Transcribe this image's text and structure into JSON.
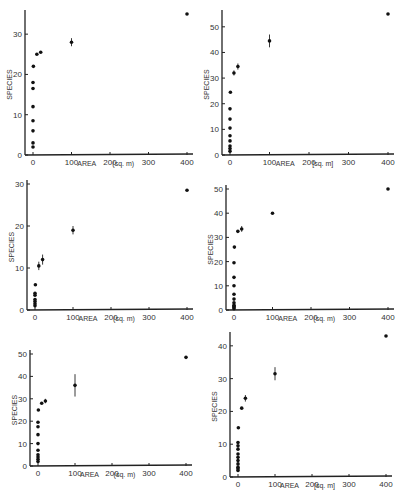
{
  "figure": {
    "panel_count": 6,
    "layout": "3 rows x 2 columns"
  },
  "chart_data": [
    {
      "type": "scatter",
      "title": "",
      "xlabel": "AREA",
      "xunit": "(sq. m)",
      "ylabel": "SPECIES",
      "xlim": [
        0,
        400
      ],
      "ylim": [
        0,
        35
      ],
      "xticks": [
        0,
        100,
        200,
        300,
        400
      ],
      "yticks": [
        0,
        10,
        20,
        30
      ],
      "grid": false,
      "points": [
        {
          "x": 0,
          "y": 2
        },
        {
          "x": 0,
          "y": 3
        },
        {
          "x": 0,
          "y": 6
        },
        {
          "x": 0,
          "y": 8.5
        },
        {
          "x": 0,
          "y": 12
        },
        {
          "x": 0,
          "y": 16.5
        },
        {
          "x": 0,
          "y": 18
        },
        {
          "x": 1,
          "y": 22
        },
        {
          "x": 10,
          "y": 25
        },
        {
          "x": 20,
          "y": 25.5
        },
        {
          "x": 100,
          "y": 28,
          "err": 1
        },
        {
          "x": 400,
          "y": 35
        }
      ],
      "frame": {
        "left": 25,
        "top": 10,
        "width": 168,
        "height": 145
      }
    },
    {
      "type": "scatter",
      "title": "",
      "xlabel": "AREA",
      "xunit": "[sq. m]",
      "ylabel": "SPECIES",
      "xlim": [
        0,
        400
      ],
      "ylim": [
        0,
        55
      ],
      "xticks": [
        0,
        100,
        200,
        300,
        400
      ],
      "yticks": [
        0,
        10,
        20,
        30,
        40,
        50
      ],
      "grid": false,
      "points": [
        {
          "x": 0,
          "y": 1.5
        },
        {
          "x": 0,
          "y": 2.5
        },
        {
          "x": 0,
          "y": 3.5
        },
        {
          "x": 0,
          "y": 5.5
        },
        {
          "x": 0,
          "y": 7.5
        },
        {
          "x": 0,
          "y": 10.5
        },
        {
          "x": 0,
          "y": 14
        },
        {
          "x": 0,
          "y": 18
        },
        {
          "x": 1,
          "y": 24.5
        },
        {
          "x": 10,
          "y": 32,
          "err": 1
        },
        {
          "x": 20,
          "y": 34.5,
          "err": 1.2
        },
        {
          "x": 100,
          "y": 44.5,
          "err": 2.5
        },
        {
          "x": 400,
          "y": 55
        }
      ],
      "frame": {
        "left": 222,
        "top": 10,
        "width": 172,
        "height": 145
      }
    },
    {
      "type": "scatter",
      "title": "",
      "xlabel": "AREA",
      "xunit": "(sq. m)",
      "ylabel": "SPECIES",
      "xlim": [
        0,
        400
      ],
      "ylim": [
        0,
        30
      ],
      "xticks": [
        0,
        100,
        200,
        300,
        400
      ],
      "yticks": [
        0,
        10,
        20,
        30
      ],
      "grid": false,
      "points": [
        {
          "x": 0,
          "y": 1
        },
        {
          "x": 0,
          "y": 1.5
        },
        {
          "x": 0,
          "y": 2
        },
        {
          "x": 0,
          "y": 2.5
        },
        {
          "x": 0,
          "y": 3.5
        },
        {
          "x": 0,
          "y": 4
        },
        {
          "x": 1,
          "y": 6
        },
        {
          "x": 10,
          "y": 10.5,
          "err": 1
        },
        {
          "x": 20,
          "y": 12,
          "err": 1.2
        },
        {
          "x": 100,
          "y": 19,
          "err": 1
        },
        {
          "x": 400,
          "y": 28.5
        }
      ],
      "frame": {
        "left": 27,
        "top": 180,
        "width": 166,
        "height": 130
      }
    },
    {
      "type": "scatter",
      "title": "",
      "xlabel": "AREA",
      "xunit": "(sq. m)",
      "ylabel": "SPECIES",
      "xlim": [
        0,
        400
      ],
      "ylim": [
        0,
        50
      ],
      "xticks": [
        0,
        100,
        200,
        300,
        400
      ],
      "yticks": [
        0,
        10,
        20,
        30,
        40,
        50
      ],
      "grid": false,
      "points": [
        {
          "x": 0,
          "y": 0.5
        },
        {
          "x": 0,
          "y": 1
        },
        {
          "x": 0,
          "y": 1.5
        },
        {
          "x": 0,
          "y": 2
        },
        {
          "x": 0,
          "y": 3
        },
        {
          "x": 0,
          "y": 4.5
        },
        {
          "x": 0,
          "y": 6.5
        },
        {
          "x": 0,
          "y": 10
        },
        {
          "x": 0,
          "y": 13.5
        },
        {
          "x": 0,
          "y": 19.5
        },
        {
          "x": 1,
          "y": 26
        },
        {
          "x": 10,
          "y": 32.5
        },
        {
          "x": 20,
          "y": 33.5,
          "err": 1.2
        },
        {
          "x": 100,
          "y": 40
        },
        {
          "x": 400,
          "y": 50
        }
      ],
      "frame": {
        "left": 226,
        "top": 185,
        "width": 168,
        "height": 125
      }
    },
    {
      "type": "scatter",
      "title": "",
      "xlabel": "AREA",
      "xunit": "(sq. m)",
      "ylabel": "SPECIES",
      "xlim": [
        0,
        400
      ],
      "ylim": [
        0,
        50
      ],
      "xticks": [
        0,
        100,
        200,
        300,
        400
      ],
      "yticks": [
        0,
        10,
        20,
        30,
        40,
        50
      ],
      "grid": false,
      "points": [
        {
          "x": 0,
          "y": 2
        },
        {
          "x": 0,
          "y": 3
        },
        {
          "x": 0,
          "y": 4
        },
        {
          "x": 0,
          "y": 5
        },
        {
          "x": 0,
          "y": 7
        },
        {
          "x": 0,
          "y": 10
        },
        {
          "x": 0,
          "y": 14
        },
        {
          "x": 0,
          "y": 17.5
        },
        {
          "x": 0,
          "y": 19.5
        },
        {
          "x": 1,
          "y": 25
        },
        {
          "x": 10,
          "y": 28
        },
        {
          "x": 20,
          "y": 29,
          "err": 1
        },
        {
          "x": 100,
          "y": 36,
          "err": 5
        },
        {
          "x": 400,
          "y": 48.5
        }
      ],
      "frame": {
        "left": 30,
        "top": 350,
        "width": 162,
        "height": 116
      }
    },
    {
      "type": "scatter",
      "title": "",
      "xlabel": "AREA",
      "xunit": "[sq. m]",
      "ylabel": "SPECIES",
      "xlim": [
        0,
        400
      ],
      "ylim": [
        0,
        43
      ],
      "xticks": [
        0,
        100,
        200,
        300,
        400
      ],
      "yticks": [
        0,
        10,
        20,
        30,
        40
      ],
      "grid": false,
      "points": [
        {
          "x": 0,
          "y": 2
        },
        {
          "x": 0,
          "y": 2.5
        },
        {
          "x": 0,
          "y": 3
        },
        {
          "x": 0,
          "y": 4
        },
        {
          "x": 0,
          "y": 5
        },
        {
          "x": 0,
          "y": 6
        },
        {
          "x": 0,
          "y": 7
        },
        {
          "x": 0,
          "y": 8.5
        },
        {
          "x": 0,
          "y": 9.5
        },
        {
          "x": 0,
          "y": 10.5
        },
        {
          "x": 1,
          "y": 15
        },
        {
          "x": 10,
          "y": 21
        },
        {
          "x": 20,
          "y": 24,
          "err": 1
        },
        {
          "x": 100,
          "y": 31.5,
          "err": 2
        },
        {
          "x": 400,
          "y": 43
        }
      ],
      "frame": {
        "left": 230,
        "top": 332,
        "width": 162,
        "height": 145
      }
    }
  ]
}
